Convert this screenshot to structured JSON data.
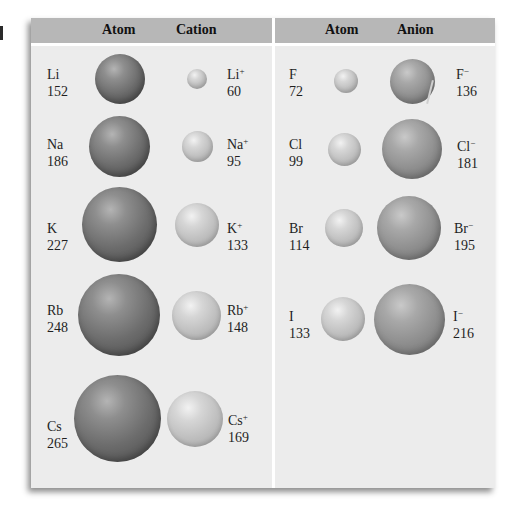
{
  "figure": {
    "left_panel": {
      "headers": [
        "Atom",
        "Cation"
      ],
      "rows": [
        {
          "atom": {
            "symbol": "Li",
            "radius": "152"
          },
          "ion": {
            "symbol": "Li",
            "charge": "+",
            "radius": "60"
          }
        },
        {
          "atom": {
            "symbol": "Na",
            "radius": "186"
          },
          "ion": {
            "symbol": "Na",
            "charge": "+",
            "radius": "95"
          }
        },
        {
          "atom": {
            "symbol": "K",
            "radius": "227"
          },
          "ion": {
            "symbol": "K",
            "charge": "+",
            "radius": "133"
          }
        },
        {
          "atom": {
            "symbol": "Rb",
            "radius": "248"
          },
          "ion": {
            "symbol": "Rb",
            "charge": "+",
            "radius": "148"
          }
        },
        {
          "atom": {
            "symbol": "Cs",
            "radius": "265"
          },
          "ion": {
            "symbol": "Cs",
            "charge": "+",
            "radius": "169"
          }
        }
      ]
    },
    "right_panel": {
      "headers": [
        "Atom",
        "Anion"
      ],
      "rows": [
        {
          "atom": {
            "symbol": "F",
            "radius": "72"
          },
          "ion": {
            "symbol": "F",
            "charge": "−",
            "radius": "136"
          }
        },
        {
          "atom": {
            "symbol": "Cl",
            "radius": "99"
          },
          "ion": {
            "symbol": "Cl",
            "charge": "−",
            "radius": "181"
          }
        },
        {
          "atom": {
            "symbol": "Br",
            "radius": "114"
          },
          "ion": {
            "symbol": "Br",
            "charge": "−",
            "radius": "195"
          }
        },
        {
          "atom": {
            "symbol": "I",
            "radius": "133"
          },
          "ion": {
            "symbol": "I",
            "charge": "−",
            "radius": "216"
          }
        }
      ]
    },
    "colors": {
      "panel_bg": "#ececec",
      "header_bg": "#b7b7b7",
      "divider": "#ffffff",
      "neutral_atom_sphere": "#6c6c6c",
      "cation_sphere": "#bdbdbd",
      "anion_sphere": "#8c8c8c",
      "halogen_atom_sphere": "#bdbdbd"
    }
  }
}
